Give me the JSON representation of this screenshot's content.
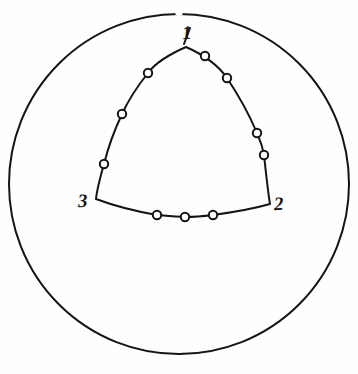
{
  "figure": {
    "background_color": "#fefefe",
    "ink_color": "#141414",
    "width": 358,
    "height": 374,
    "outer_circle": {
      "name": "outer-circle",
      "center_x": 179,
      "center_y": 184,
      "radius": 170,
      "stroke_width": 2.0
    },
    "triangle": {
      "name": "curvilinear-triangle",
      "stroke_width": 2.0,
      "vertices": [
        {
          "id": "1",
          "label": "1",
          "x": 186,
          "y": 47
        },
        {
          "id": "2",
          "label": "2",
          "x": 270,
          "y": 204
        },
        {
          "id": "3",
          "label": "3",
          "x": 96,
          "y": 199
        }
      ],
      "path": "M 186 47 C 170 54 156 62 148 73 C 136 88 128 101 122 114 C 114 131 108 148 104 164 C 100 178 97 189 96 199 C 112 205 134 211 157 215 C 168 216 178 217 185 217 C 196 217 205 216 213 215 C 235 212 256 208 270 204 C 268 192 266 173 264 155 C 262 144 259 138 257 133 C 249 114 239 96 227 78 C 218 65 202 54 186 47 Z"
    },
    "markers": {
      "name": "data-point-markers",
      "radius": 4.2,
      "stroke_width": 2.0,
      "fill": "#fefefe",
      "count": 11,
      "points": [
        {
          "x": 148,
          "y": 73,
          "side": "left-upper-arc"
        },
        {
          "x": 122,
          "y": 114,
          "side": "left-upper-arc"
        },
        {
          "x": 104,
          "y": 164,
          "side": "left-lower-arc"
        },
        {
          "x": 157,
          "y": 215,
          "side": "bottom-arc"
        },
        {
          "x": 185,
          "y": 217,
          "side": "bottom-arc"
        },
        {
          "x": 213,
          "y": 215,
          "side": "bottom-arc"
        },
        {
          "x": 264,
          "y": 155,
          "side": "right-lower-arc"
        },
        {
          "x": 257,
          "y": 133,
          "side": "right-lower-arc"
        },
        {
          "x": 227,
          "y": 78,
          "side": "right-upper-arc"
        },
        {
          "x": 205,
          "y": 56,
          "side": "right-upper-arc"
        }
      ]
    },
    "apex_tick": {
      "name": "apex-index-stroke",
      "x1": 190,
      "y1": 28,
      "x2": 184,
      "y2": 44
    },
    "circle_top_gap": {
      "name": "circle-top-gap",
      "x": 179,
      "y": 13
    }
  }
}
